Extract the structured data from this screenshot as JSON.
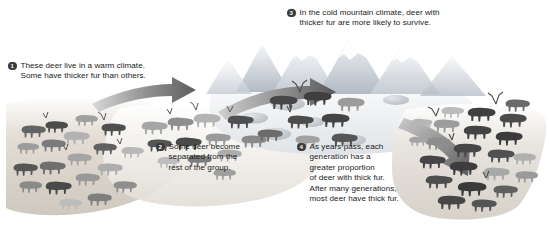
{
  "diagram": {
    "subject": "deer",
    "type": "process-diagram",
    "panel_width": 549,
    "panel_height": 228,
    "background_color": "#ffffff",
    "text_color": "#1a1a1a",
    "bullet_color": "#3a3a3a",
    "bullet_text_color": "#ffffff"
  },
  "callouts": [
    {
      "number": "1",
      "text": "These deer live in a warm climate.\nSome have thicker fur than others."
    },
    {
      "number": "2",
      "text": "Some deer become\nseparated from the\nrest of the group."
    },
    {
      "number": "3",
      "text": "In the cold mountain climate, deer with\nthicker fur are more likely to survive."
    },
    {
      "number": "4",
      "text": "As years pass, each\ngeneration has a\ngreater proportion\nof deer with thick fur.\nAfter many generations,\nmost deer have thick fur."
    }
  ],
  "scene": {
    "regions": [
      {
        "name": "warm-lowland-left",
        "label": "warm climate ground",
        "ground_color": "#d8d2cb"
      },
      {
        "name": "migration-middle",
        "label": "deer migrating",
        "ground_color": "#e6e3de"
      },
      {
        "name": "cold-mountain-upper",
        "label": "cold mountain climate",
        "ground_color": "#eceef0"
      },
      {
        "name": "later-generations-right",
        "label": "later generations herd",
        "ground_color": "#dedbd6"
      }
    ],
    "arrows": [
      {
        "name": "arrow-lowland-to-middle",
        "direction": "right"
      },
      {
        "name": "arrow-middle-to-mountain",
        "direction": "right"
      },
      {
        "name": "arrow-mountain-to-later",
        "direction": "down-right"
      }
    ],
    "herds": [
      {
        "name": "herd-warm-lowland",
        "count": 19,
        "thick_fur_fraction": "few"
      },
      {
        "name": "herd-migrating",
        "count": 12,
        "thick_fur_fraction": "some"
      },
      {
        "name": "herd-cold-mountain",
        "count": 8,
        "thick_fur_fraction": "many"
      },
      {
        "name": "herd-later-generations",
        "count": 22,
        "thick_fur_fraction": "most"
      }
    ],
    "mountains": {
      "name": "mountain-range",
      "peaks": 5,
      "color": "#c9cfd6"
    },
    "rocks": {
      "name": "scattered-rocks",
      "count": 7,
      "color": "#c6cbd0"
    }
  },
  "deer_colors": {
    "thick_fur_dark": "#4a4a4a",
    "thick_fur_darkest": "#3b3b3b",
    "thin_fur_light": "#a8a8a8",
    "thin_fur_lightest": "#bdbdbd",
    "medium": "#8c8c8c"
  }
}
